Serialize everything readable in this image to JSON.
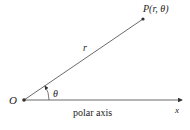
{
  "diagram": {
    "type": "polar-coordinates",
    "origin_label": "O",
    "point_label": "P(r, θ)",
    "radius_label": "r",
    "angle_label": "θ",
    "axis_label": "polar axis",
    "x_label": "x",
    "colors": {
      "line": "#333333",
      "text": "#222222",
      "point": "#333333"
    }
  }
}
